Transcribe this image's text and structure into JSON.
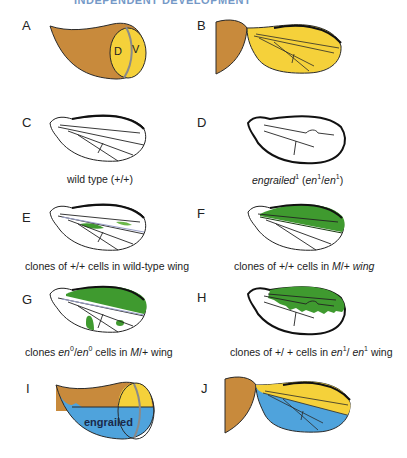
{
  "header": {
    "partial_title": "INDEPENDENT DEVELOPMENT"
  },
  "colors": {
    "notum_brown": "#c88a3c",
    "dorsal_yellow": "#f5d13a",
    "ventral_blue": "#4fa3dc",
    "clone_green": "#3f9a2f",
    "outline": "#2a2a2a",
    "boundary_gray": "#8a8a8a"
  },
  "panels": [
    {
      "id": "A",
      "label": "A",
      "disc_labels": {
        "dorsal": "D",
        "ventral": "V"
      },
      "caption": ""
    },
    {
      "id": "B",
      "label": "B",
      "caption": ""
    },
    {
      "id": "C",
      "label": "C",
      "caption": "wild type (+/+)"
    },
    {
      "id": "D",
      "label": "D",
      "caption_parts": {
        "italic1": "engrailed",
        "sup1": "1",
        "plain1": " (",
        "italic2": "en",
        "sup2": "1",
        "plain2": "/",
        "italic3": "en",
        "sup3": "1",
        "plain3": ")"
      }
    },
    {
      "id": "E",
      "label": "E",
      "caption": "clones of +/+ cells in wild-type wing"
    },
    {
      "id": "F",
      "label": "F",
      "caption_parts": {
        "plain1": "clones of +/+ cells in ",
        "italic1": "M",
        "plain2": "/+ ",
        "italic2": "wing"
      }
    },
    {
      "id": "G",
      "label": "G",
      "caption_parts": {
        "plain1": "clones ",
        "italic1": "en",
        "sup1": "0",
        "plain2": "/",
        "italic2": "en",
        "sup2": "0",
        "plain3": " cells in ",
        "italic3": "M",
        "plain4": "/+ wing"
      }
    },
    {
      "id": "H",
      "label": "H",
      "caption_parts": {
        "plain1": "clones of  +/ + cells in ",
        "italic1": "en",
        "sup1": "1",
        "plain2": "/ ",
        "italic2": "en",
        "sup2": "1",
        "plain3": " wing"
      }
    },
    {
      "id": "I",
      "label": "I",
      "region_label": "engrailed",
      "caption": ""
    },
    {
      "id": "J",
      "label": "J",
      "caption": ""
    }
  ]
}
